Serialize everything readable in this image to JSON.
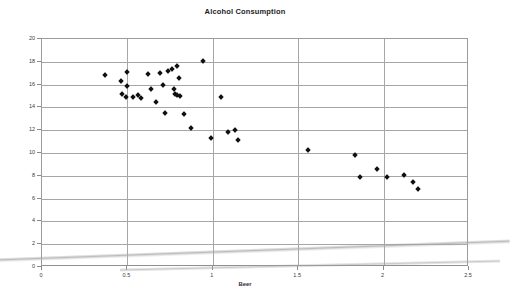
{
  "chart_data": {
    "type": "scatter",
    "title": "Alcohol Consumption",
    "xlabel": "Beer",
    "ylabel": "Wine",
    "xlim": [
      0,
      2.5
    ],
    "ylim": [
      0,
      20
    ],
    "xticks": [
      "0",
      "0.5",
      "1",
      "1.5",
      "2",
      "2.5"
    ],
    "xtick_values": [
      0,
      0.5,
      1,
      1.5,
      2,
      2.5
    ],
    "yticks": [
      "0",
      "2",
      "4",
      "6",
      "8",
      "10",
      "12",
      "14",
      "16",
      "18",
      "20"
    ],
    "ytick_values": [
      0,
      2,
      4,
      6,
      8,
      10,
      12,
      14,
      16,
      18,
      20
    ],
    "grid": "both",
    "legend": "none",
    "marker": "diamond",
    "marker_color": "#101010",
    "series": [
      {
        "name": "Countries",
        "points": [
          [
            0.37,
            16.8
          ],
          [
            0.46,
            16.3
          ],
          [
            0.47,
            15.2
          ],
          [
            0.49,
            14.9
          ],
          [
            0.5,
            17.1
          ],
          [
            0.5,
            15.9
          ],
          [
            0.53,
            14.9
          ],
          [
            0.56,
            15.1
          ],
          [
            0.58,
            14.8
          ],
          [
            0.62,
            16.9
          ],
          [
            0.64,
            15.6
          ],
          [
            0.67,
            14.5
          ],
          [
            0.69,
            17.0
          ],
          [
            0.71,
            16.0
          ],
          [
            0.72,
            13.5
          ],
          [
            0.74,
            17.2
          ],
          [
            0.76,
            17.4
          ],
          [
            0.77,
            15.6
          ],
          [
            0.78,
            15.2
          ],
          [
            0.79,
            15.1
          ],
          [
            0.79,
            17.6
          ],
          [
            0.8,
            16.6
          ],
          [
            0.81,
            15.0
          ],
          [
            0.83,
            13.4
          ],
          [
            0.87,
            12.2
          ],
          [
            0.94,
            18.1
          ],
          [
            0.99,
            11.3
          ],
          [
            1.05,
            14.9
          ],
          [
            1.09,
            11.8
          ],
          [
            1.13,
            12.0
          ],
          [
            1.15,
            11.1
          ],
          [
            1.56,
            10.3
          ],
          [
            1.83,
            9.8
          ],
          [
            1.86,
            7.9
          ],
          [
            1.96,
            8.6
          ],
          [
            2.02,
            7.9
          ],
          [
            2.12,
            8.1
          ],
          [
            2.17,
            7.5
          ],
          [
            2.2,
            6.8
          ]
        ]
      }
    ]
  },
  "colors": {
    "grid": "#a6a6a6",
    "axis": "#8f8f8f",
    "marker": "#101010",
    "text": "#2b2b2b",
    "background": "#ffffff"
  }
}
